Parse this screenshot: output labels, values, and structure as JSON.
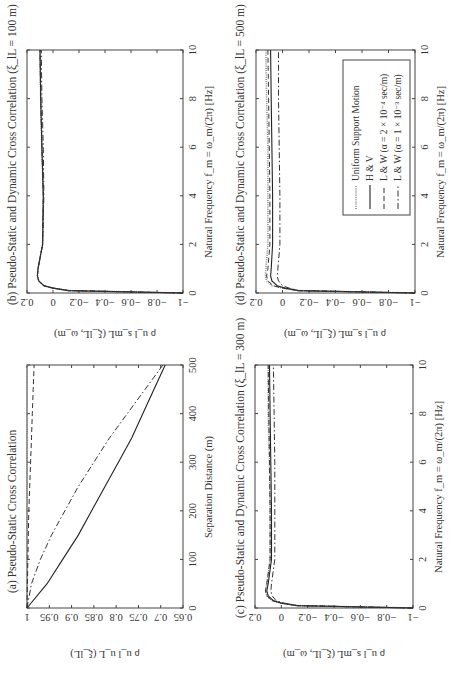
{
  "figure": {
    "orientation": "rotated 90 degrees counter-clockwise (landscape figure on portrait page)",
    "legend": {
      "items": [
        {
          "label": "Uniform Support Motion",
          "style": "dotted",
          "key": "unif"
        },
        {
          "label": "H & V",
          "style": "solid",
          "key": "hv"
        },
        {
          "label": "L & W (α = 2 × 10⁻⁴ sec/m)",
          "style": "dashed",
          "key": "lw1"
        },
        {
          "label": "L & W (α = 1 × 10⁻³ sec/m)",
          "style": "dash-dot",
          "key": "lw2"
        }
      ]
    },
    "panels": {
      "a": {
        "title": "(a) Pseudo-Static Cross Correlation",
        "xlabel": "Separation Distance (m)",
        "ylabel": "ρ u_l u_L (ξ_lL)",
        "xticks": [
          "0",
          "100",
          "200",
          "300",
          "400",
          "500"
        ],
        "yticks": [
          "1",
          "0.95",
          "0.9",
          "0.85",
          "0.8",
          "0.75",
          "0.7",
          "0.65"
        ]
      },
      "b": {
        "title": "(b) Pseudo-Static and Dynamic Cross Correlation (ξ_lL = 100 m)",
        "xlabel": "Natural Frequency f_m = ω_m/(2π) [Hz]",
        "ylabel": "ρ u_l s_mL (ξ_lL, ω_m)",
        "xticks": [
          "0",
          "2",
          "4",
          "6",
          "8",
          "10"
        ],
        "yticks": [
          "0.2",
          "0",
          "−0.2",
          "−0.4",
          "−0.6",
          "−0.8",
          "−1"
        ]
      },
      "c": {
        "title": "(c) Pseudo-Static and Dynamic Cross Correlation (ξ_lL = 300 m)",
        "xlabel": "Natural Frequency f_m = ω_m/(2π) [Hz]",
        "ylabel": "ρ u_l s_mL (ξ_lL, ω_m)",
        "xticks": [
          "0",
          "2",
          "4",
          "6",
          "8",
          "10"
        ],
        "yticks": [
          "0.2",
          "0",
          "−0.2",
          "−0.4",
          "−0.6",
          "−0.8",
          "−1"
        ]
      },
      "d": {
        "title": "(d) Pseudo-Static and Dynamic Cross Correlation (ξ_lL = 500 m)",
        "xlabel": "Natural Frequency f_m = ω_m/(2π) [Hz]",
        "ylabel": "ρ u_l s_mL (ξ_lL, ω_m)",
        "xticks": [
          "0",
          "2",
          "4",
          "6",
          "8",
          "10"
        ],
        "yticks": [
          "0.2",
          "0",
          "−0.2",
          "−0.4",
          "−0.6",
          "−0.8",
          "−1"
        ]
      }
    }
  },
  "chart_data": [
    {
      "type": "line",
      "title": "(a) Pseudo-Static Cross Correlation",
      "xlabel": "Separation Distance (m)",
      "ylabel": "ρ_{u_l u_L}(ξ_lL)",
      "xlim": [
        0,
        500
      ],
      "ylim": [
        0.65,
        1
      ],
      "x": [
        0,
        50,
        100,
        150,
        200,
        250,
        300,
        350,
        400,
        450,
        500
      ],
      "series": [
        {
          "name": "Uniform Support Motion",
          "values": [
            1,
            1,
            1,
            1,
            1,
            1,
            1,
            1,
            1,
            1,
            1
          ]
        },
        {
          "name": "H & V",
          "values": [
            1,
            0.955,
            0.92,
            0.885,
            0.855,
            0.825,
            0.795,
            0.765,
            0.74,
            0.715,
            0.69
          ]
        },
        {
          "name": "L & W (α = 2 × 10⁻⁴ sec/m)",
          "values": [
            1,
            0.999,
            0.998,
            0.997,
            0.996,
            0.994,
            0.992,
            0.99,
            0.988,
            0.986,
            0.984
          ]
        },
        {
          "name": "L & W (α = 1 × 10⁻³ sec/m)",
          "values": [
            1,
            0.99,
            0.97,
            0.945,
            0.915,
            0.885,
            0.85,
            0.815,
            0.775,
            0.735,
            0.695
          ]
        }
      ]
    },
    {
      "type": "line",
      "title": "(b) Pseudo-Static and Dynamic Cross Correlation (ξ_lL = 100 m)",
      "xlabel": "Natural Frequency f_m = ω_m/(2π) [Hz]",
      "ylabel": "ρ_{u_l s_mL}(ξ_lL, ω_m)",
      "xlim": [
        0,
        10
      ],
      "ylim": [
        -1,
        0.2
      ],
      "x": [
        0,
        0.1,
        0.2,
        0.3,
        0.5,
        0.7,
        1,
        2,
        4,
        6,
        8,
        10
      ],
      "series": [
        {
          "name": "Uniform Support Motion",
          "values": [
            -1,
            -0.12,
            0.0,
            0.07,
            0.11,
            0.12,
            0.115,
            0.08,
            0.075,
            0.085,
            0.095,
            0.1
          ]
        },
        {
          "name": "H & V",
          "values": [
            -1,
            -0.12,
            0.0,
            0.07,
            0.11,
            0.12,
            0.115,
            0.08,
            0.075,
            0.085,
            0.095,
            0.1
          ]
        },
        {
          "name": "L & W (α = 2 × 10⁻⁴ sec/m)",
          "values": [
            -1,
            -0.12,
            0.0,
            0.07,
            0.11,
            0.12,
            0.115,
            0.08,
            0.075,
            0.085,
            0.095,
            0.1
          ]
        },
        {
          "name": "L & W (α = 1 × 10⁻³ sec/m)",
          "values": [
            -1,
            -0.12,
            0.0,
            0.07,
            0.11,
            0.12,
            0.115,
            0.08,
            0.07,
            0.075,
            0.085,
            0.09
          ]
        }
      ]
    },
    {
      "type": "line",
      "title": "(c) Pseudo-Static and Dynamic Cross Correlation (ξ_lL = 300 m)",
      "xlabel": "Natural Frequency f_m = ω_m/(2π) [Hz]",
      "ylabel": "ρ_{u_l s_mL}(ξ_lL, ω_m)",
      "xlim": [
        0,
        10
      ],
      "ylim": [
        -1,
        0.2
      ],
      "x": [
        0,
        0.1,
        0.2,
        0.3,
        0.5,
        0.7,
        1,
        2,
        4,
        6,
        8,
        10
      ],
      "series": [
        {
          "name": "Uniform Support Motion",
          "values": [
            -1,
            -0.12,
            0.0,
            0.07,
            0.11,
            0.12,
            0.11,
            0.085,
            0.085,
            0.09,
            0.1,
            0.1
          ]
        },
        {
          "name": "H & V",
          "values": [
            -1,
            -0.12,
            0.0,
            0.06,
            0.1,
            0.11,
            0.1,
            0.075,
            0.075,
            0.08,
            0.085,
            0.09
          ]
        },
        {
          "name": "L & W (α = 2 × 10⁻⁴ sec/m)",
          "values": [
            -1,
            -0.12,
            0.0,
            0.07,
            0.11,
            0.12,
            0.11,
            0.085,
            0.085,
            0.09,
            0.095,
            0.1
          ]
        },
        {
          "name": "L & W (α = 1 × 10⁻³ sec/m)",
          "values": [
            -1,
            -0.12,
            -0.02,
            0.04,
            0.07,
            0.08,
            0.075,
            0.05,
            0.05,
            0.05,
            0.055,
            0.06
          ]
        }
      ]
    },
    {
      "type": "line",
      "title": "(d) Pseudo-Static and Dynamic Cross Correlation (ξ_lL = 500 m)",
      "xlabel": "Natural Frequency f_m = ω_m/(2π) [Hz]",
      "ylabel": "ρ_{u_l s_mL}(ξ_lL, ω_m)",
      "xlim": [
        0,
        10
      ],
      "ylim": [
        -1,
        0.2
      ],
      "legend": [
        "Uniform Support Motion",
        "H & V",
        "L & W (α = 2 × 10⁻⁴ sec/m)",
        "L & W (α = 1 × 10⁻³ sec/m)"
      ],
      "x": [
        0,
        0.1,
        0.2,
        0.3,
        0.5,
        0.7,
        1,
        2,
        4,
        6,
        8,
        10
      ],
      "series": [
        {
          "name": "Uniform Support Motion",
          "values": [
            -1,
            -0.12,
            0.0,
            0.08,
            0.12,
            0.13,
            0.125,
            0.11,
            0.11,
            0.11,
            0.12,
            0.125
          ]
        },
        {
          "name": "H & V",
          "values": [
            -1,
            -0.12,
            -0.02,
            0.04,
            0.08,
            0.09,
            0.085,
            0.075,
            0.075,
            0.08,
            0.085,
            0.09
          ]
        },
        {
          "name": "L & W (α = 2 × 10⁻⁴ sec/m)",
          "values": [
            -1,
            -0.12,
            0.0,
            0.07,
            0.11,
            0.12,
            0.11,
            0.095,
            0.095,
            0.1,
            0.105,
            0.11
          ]
        },
        {
          "name": "L & W (α = 1 × 10⁻³ sec/m)",
          "values": [
            -1,
            -0.12,
            -0.05,
            0.0,
            0.03,
            0.04,
            0.035,
            0.02,
            0.02,
            0.025,
            0.03,
            0.03
          ]
        }
      ]
    }
  ]
}
